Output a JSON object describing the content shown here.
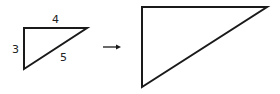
{
  "diagram": {
    "stroke_color": "#1a1a1a",
    "small_triangle": {
      "points": [
        [
          24,
          28
        ],
        [
          87,
          28
        ],
        [
          24,
          69
        ]
      ],
      "labels": {
        "top": {
          "text": "4",
          "x": 55,
          "y": 23
        },
        "left": {
          "text": "3",
          "x": 13,
          "y": 53
        },
        "hypotenuse": {
          "text": "5",
          "x": 61,
          "y": 61
        }
      }
    },
    "arrow": {
      "x1": 103,
      "y1": 47,
      "x2": 121,
      "y2": 47
    },
    "large_triangle": {
      "points": [
        [
          142,
          7
        ],
        [
          267,
          7
        ],
        [
          142,
          87
        ]
      ]
    }
  }
}
